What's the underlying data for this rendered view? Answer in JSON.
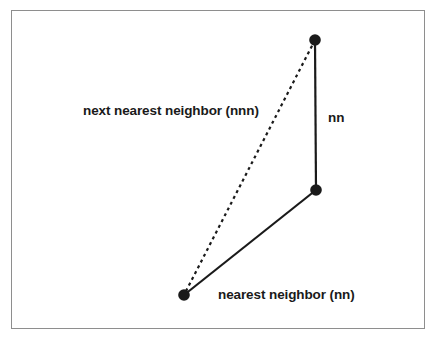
{
  "figure": {
    "background_color": "#ffffff",
    "frame": {
      "border_color": "#8e8e8e",
      "fill_color": "#ffffff"
    },
    "stroke_color": "#1a1a1a",
    "node_color": "#1a1a1a",
    "labels": {
      "nnn": "next nearest neighbor (nnn)",
      "nn_vertical": "nn",
      "nn_bottom": "nearest neighbor (nn)"
    },
    "nodes": [
      {
        "id": "top",
        "x": 315,
        "y": 40,
        "radius": 5.8
      },
      {
        "id": "middle",
        "x": 316,
        "y": 190,
        "radius": 5.8
      },
      {
        "id": "bottom_left",
        "x": 184,
        "y": 295,
        "radius": 5.8
      }
    ],
    "edges": [
      {
        "id": "nn-vertical",
        "from": "top",
        "to": "middle",
        "style": "solid",
        "width": 2.2
      },
      {
        "id": "nn-diagonal",
        "from": "middle",
        "to": "bottom_left",
        "style": "solid",
        "width": 2.2
      },
      {
        "id": "nnn-dashed",
        "from": "top",
        "to": "bottom_left",
        "style": "dashed",
        "width": 2.2,
        "dash_pattern": "3 3.5"
      }
    ]
  }
}
